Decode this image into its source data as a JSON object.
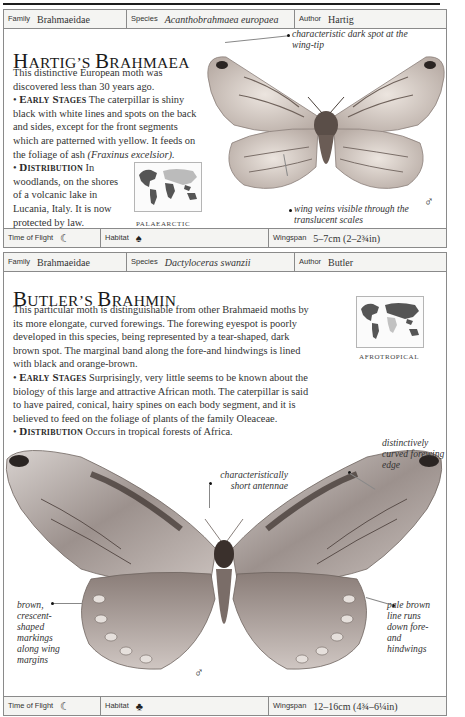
{
  "entries": [
    {
      "header": {
        "family_label": "Family",
        "family_value": "Brahmaeidae",
        "species_label": "Species",
        "species_value": "Acanthobrahmaea europaea",
        "author_label": "Author",
        "author_value": "Hartig"
      },
      "title_caps": [
        "H",
        "ARTIG",
        "'S ",
        "B",
        "RAHMAEA"
      ],
      "intro": "This distinctive European moth was discovered less than 30 years ago.",
      "early_stages_heading": "Early Stages",
      "early_stages_text": "The caterpillar is shiny black with white lines and spots on the back and sides, except for the front segments which are patterned with yellow. It feeds on the foliage of ash",
      "early_stages_latin": "(Fraxinus excelsior).",
      "distribution_heading": "Distribution",
      "distribution_text": "In woodlands, on the shores of a volcanic lake in Lucania, Italy. It is now protected by law.",
      "map_caption": "Palaearctic",
      "annotations": [
        "characteristic dark spot at the wing-tip",
        "wing veins visible through the translucent scales"
      ],
      "sex_symbol": "♂",
      "footer": {
        "time_label": "Time of Flight",
        "time_icon": "moon-icon",
        "time_glyph": "☾",
        "habitat_label": "Habitat",
        "habitat_icon": "deciduous-tree-icon",
        "habitat_glyph": "♠",
        "wingspan_label": "Wingspan",
        "wingspan_value": "5–7cm (2–2¾in)"
      }
    },
    {
      "header": {
        "family_label": "Family",
        "family_value": "Brahmaeidae",
        "species_label": "Species",
        "species_value": "Dactyloceras swanzii",
        "author_label": "Author",
        "author_value": "Butler"
      },
      "intro": "This particular moth is distinguishable from other Brahmaeid moths by its more elongate, curved forewings. The forewing eyespot is poorly developed in this species, being represented by a tear-shaped, dark brown spot. The marginal band along the fore-and hindwings is lined with black and orange-brown.",
      "early_stages_heading": "Early Stages",
      "early_stages_text": "Surprisingly, very little seems to be known about the biology of this large and attractive African moth. The caterpillar is said to have paired, conical, hairy spines on each body segment, and it is believed to feed on the foliage of plants of the family Oleaceae.",
      "distribution_heading": "Distribution",
      "distribution_text": "Occurs in tropical forests of Africa.",
      "map_caption": "Afrotropical",
      "annotations": [
        "distinctively curved forewing edge",
        "characteristically short antennae",
        "brown, crescent-shaped markings along wing margins",
        "pale brown line runs down fore-and hindwings"
      ],
      "sex_symbol": "♂",
      "footer": {
        "time_label": "Time of Flight",
        "time_icon": "moon-icon",
        "time_glyph": "☾",
        "habitat_label": "Habitat",
        "habitat_icon": "palm-tree-icon",
        "habitat_glyph": "♣",
        "wingspan_label": "Wingspan",
        "wingspan_value": "12–16cm (4¾–6¼in)"
      }
    }
  ],
  "titles": {
    "entry1": {
      "cap1": "H",
      "rest1": "ARTIG’S ",
      "cap2": "B",
      "rest2": "RAHMAEA"
    },
    "entry2": {
      "cap1": "B",
      "rest1": "UTLER’S ",
      "cap2": "B",
      "rest2": "RAHMIN"
    }
  },
  "colors": {
    "border": "#8a8a8a",
    "meta_row_bg": "#f4f4f2",
    "text": "#333333",
    "rule": "#1e1e1e"
  }
}
